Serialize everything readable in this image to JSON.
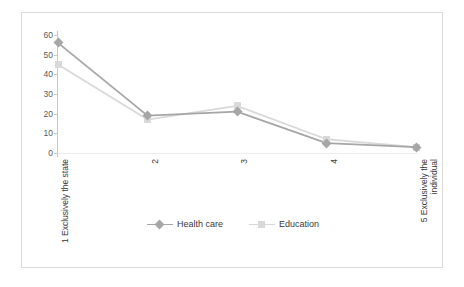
{
  "chart_data": {
    "type": "line",
    "title": "",
    "subtitle": "",
    "xlabel": "",
    "ylabel": "",
    "categories": [
      "1 Exclusively the state",
      "2",
      "3",
      "4",
      "5 Exclusively the\nindividual"
    ],
    "category_labels_rotated": true,
    "series": [
      {
        "name": "Health care",
        "color": "#a6a6a6",
        "marker": "diamond",
        "values": [
          56,
          19,
          21,
          5,
          3
        ]
      },
      {
        "name": "Education",
        "color": "#d9d9d9",
        "marker": "square",
        "values": [
          45,
          17,
          24,
          7,
          3
        ]
      }
    ],
    "ylim": [
      0,
      60
    ],
    "yticks": [
      0,
      10,
      20,
      30,
      40,
      50,
      60
    ],
    "ytick_labels": [
      "0",
      "10",
      "20",
      "30",
      "40",
      "50",
      "60"
    ],
    "grid": false,
    "legend_position": "bottom",
    "frame_border_color": "#dcdcdc",
    "axis_color": "#c9c9c9"
  },
  "legend": {
    "entries": [
      {
        "label": "Health care"
      },
      {
        "label": "Education"
      }
    ]
  }
}
